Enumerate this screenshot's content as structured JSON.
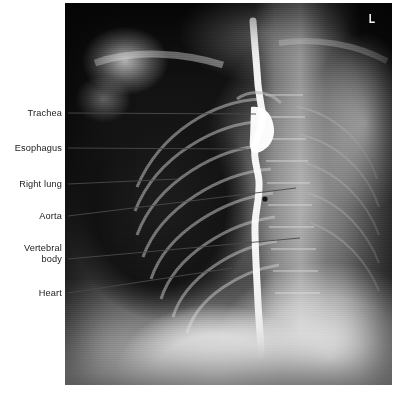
{
  "figure": {
    "kind": "annotated-radiograph",
    "modality": "chest x-ray with barium esophagram",
    "view": "frontal / slightly oblique chest",
    "background_color": "#ffffff",
    "label_color": "#1a1a1a",
    "leader_line_color": "#4a4a4a",
    "plate": {
      "x": 65,
      "y": 3,
      "width": 327,
      "height": 382
    },
    "side_marker": "L"
  },
  "labels": [
    {
      "id": "trachea",
      "text": "Trachea",
      "x": 62,
      "y": 108,
      "leader": {
        "x1": 68,
        "y1": 113,
        "x2": 256,
        "y2": 114
      }
    },
    {
      "id": "esophagus",
      "text": "Esophagus",
      "x": 62,
      "y": 143,
      "leader": {
        "x1": 68,
        "y1": 148,
        "x2": 246,
        "y2": 149
      }
    },
    {
      "id": "right-lung",
      "text": "Right lung",
      "x": 62,
      "y": 179,
      "leader": {
        "x1": 68,
        "y1": 184,
        "x2": 178,
        "y2": 179
      }
    },
    {
      "id": "aorta",
      "text": "Aorta",
      "x": 62,
      "y": 211,
      "leader": {
        "x1": 68,
        "y1": 216,
        "x2": 296,
        "y2": 188
      }
    },
    {
      "id": "vertebral-body",
      "text": "Vertebral\nbody",
      "x": 62,
      "y": 243,
      "leader": {
        "x1": 68,
        "y1": 259,
        "x2": 300,
        "y2": 238
      }
    },
    {
      "id": "heart",
      "text": "Heart",
      "x": 62,
      "y": 288,
      "leader": {
        "x1": 68,
        "y1": 293,
        "x2": 232,
        "y2": 268
      }
    }
  ]
}
